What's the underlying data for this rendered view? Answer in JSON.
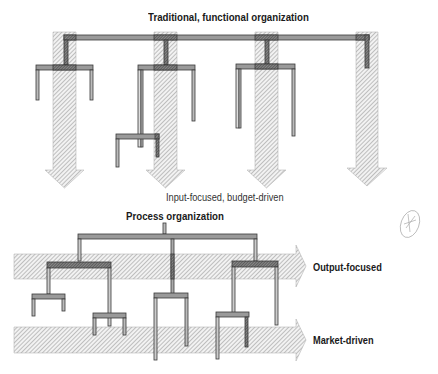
{
  "top_section": {
    "title": "Traditional, functional organization",
    "caption": "Input-focused, budget-driven"
  },
  "bottom_section": {
    "title": "Process organization",
    "arrows": [
      {
        "label": "Output-focused"
      },
      {
        "label": "Market-driven"
      }
    ]
  },
  "colors": {
    "hatch": "#8a8a8a",
    "bar_fill": "#9a9a9a",
    "bar_edge": "#444444",
    "text": "#1a1a1a"
  }
}
